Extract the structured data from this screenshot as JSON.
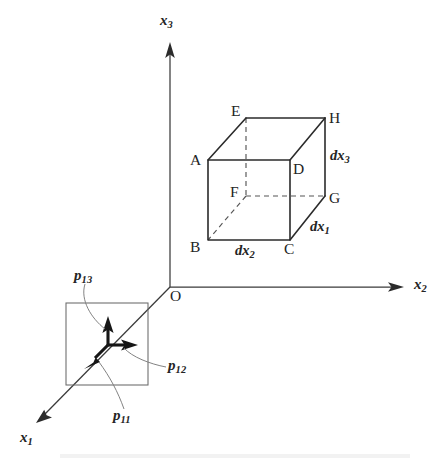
{
  "figure": {
    "background_color": "#ffffff",
    "ink_color": "#242424"
  },
  "axes": {
    "origin_label": "O",
    "items": [
      {
        "id": "x1",
        "label": "x",
        "sub": "1",
        "direction": "lower-left"
      },
      {
        "id": "x2",
        "label": "x",
        "sub": "2",
        "direction": "right"
      },
      {
        "id": "x3",
        "label": "x",
        "sub": "3",
        "direction": "up"
      }
    ]
  },
  "cube": {
    "vertices": [
      {
        "id": "A",
        "label": "A"
      },
      {
        "id": "B",
        "label": "B"
      },
      {
        "id": "C",
        "label": "C"
      },
      {
        "id": "D",
        "label": "D"
      },
      {
        "id": "E",
        "label": "E"
      },
      {
        "id": "F",
        "label": "F"
      },
      {
        "id": "G",
        "label": "G"
      },
      {
        "id": "H",
        "label": "H"
      }
    ],
    "dimensions": [
      {
        "id": "dx1",
        "label": "dx",
        "sub": "1",
        "edge": "C-G"
      },
      {
        "id": "dx2",
        "label": "dx",
        "sub": "2",
        "edge": "B-C"
      },
      {
        "id": "dx3",
        "label": "dx",
        "sub": "3",
        "edge": "G-H"
      }
    ]
  },
  "stress_element": {
    "components": [
      {
        "id": "p11",
        "label": "p",
        "sub": "11",
        "arrow": "along-x1-outward"
      },
      {
        "id": "p12",
        "label": "p",
        "sub": "12",
        "arrow": "along-x2"
      },
      {
        "id": "p13",
        "label": "p",
        "sub": "13",
        "arrow": "along-x3"
      }
    ]
  }
}
